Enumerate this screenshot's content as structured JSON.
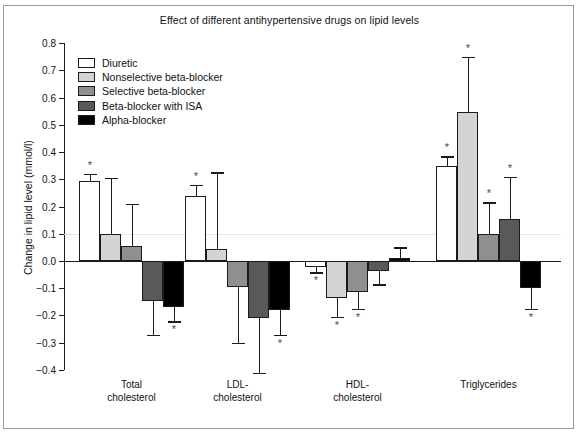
{
  "chart_data": {
    "type": "bar",
    "title": "Effect of different antihypertensive drugs on lipid levels",
    "xlabel": "",
    "ylabel": "Change in lipid level (mmol/l)",
    "ylim": [
      -0.4,
      0.8
    ],
    "ytick_labels": [
      "0.8",
      "0.7",
      "0.6",
      "0.5",
      "0.4",
      "0.3",
      "0.2",
      "0.1",
      "0.0",
      "−0.1",
      "−0.2",
      "−0.3",
      "−0.4"
    ],
    "ytick_values": [
      0.8,
      0.7,
      0.6,
      0.5,
      0.4,
      0.3,
      0.2,
      0.1,
      0.0,
      -0.1,
      -0.2,
      -0.3,
      -0.4
    ],
    "grid": false,
    "legend_position": "upper-left",
    "categories": [
      "Total\ncholesterol",
      "LDL-\ncholesterol",
      "HDL-\ncholesterol",
      "Triglycerides"
    ],
    "category_labels": [
      {
        "line1": "Total",
        "line2": "cholesterol"
      },
      {
        "line1": "LDL-",
        "line2": "cholesterol"
      },
      {
        "line1": "HDL-",
        "line2": "cholesterol"
      },
      {
        "line1": "Triglycerides",
        "line2": ""
      }
    ],
    "significance_marker": "*",
    "series": [
      {
        "name": "Diuretic",
        "color": "#ffffff",
        "values": [
          0.295,
          0.24,
          -0.022,
          0.35
        ],
        "errors_high": [
          0.32,
          0.28,
          -0.022,
          0.385
        ],
        "errors_low": [
          0.295,
          0.24,
          -0.042,
          0.35
        ],
        "significant": [
          true,
          true,
          true,
          true
        ]
      },
      {
        "name": "Nonselective beta-blocker",
        "color": "#d4d4d4",
        "values": [
          0.1,
          0.045,
          -0.135,
          0.545
        ],
        "errors_high": [
          0.305,
          0.325,
          -0.135,
          0.75
        ],
        "errors_low": [
          0.1,
          0.045,
          -0.205,
          0.545
        ],
        "significant": [
          false,
          false,
          true,
          true
        ]
      },
      {
        "name": "Selective beta-blocker",
        "color": "#8f8f8f",
        "values": [
          0.055,
          -0.095,
          -0.115,
          0.1
        ],
        "errors_high": [
          0.21,
          -0.095,
          -0.115,
          0.215
        ],
        "errors_low": [
          0.055,
          -0.3,
          -0.175,
          0.1
        ],
        "significant": [
          false,
          false,
          true,
          true
        ]
      },
      {
        "name": "Beta-blocker with ISA",
        "color": "#595959",
        "values": [
          -0.145,
          -0.21,
          -0.035,
          0.155
        ],
        "errors_high": [
          -0.145,
          -0.21,
          -0.035,
          0.31
        ],
        "errors_low": [
          -0.27,
          -0.41,
          -0.085,
          0.155
        ],
        "significant": [
          false,
          false,
          false,
          true
        ]
      },
      {
        "name": "Alpha-blocker",
        "color": "#000000",
        "values": [
          -0.17,
          -0.18,
          0.012,
          -0.1
        ],
        "errors_high": [
          -0.17,
          -0.18,
          0.05,
          -0.1
        ],
        "errors_low": [
          -0.22,
          -0.27,
          0.012,
          -0.175
        ],
        "significant": [
          true,
          true,
          false,
          true
        ]
      }
    ]
  }
}
